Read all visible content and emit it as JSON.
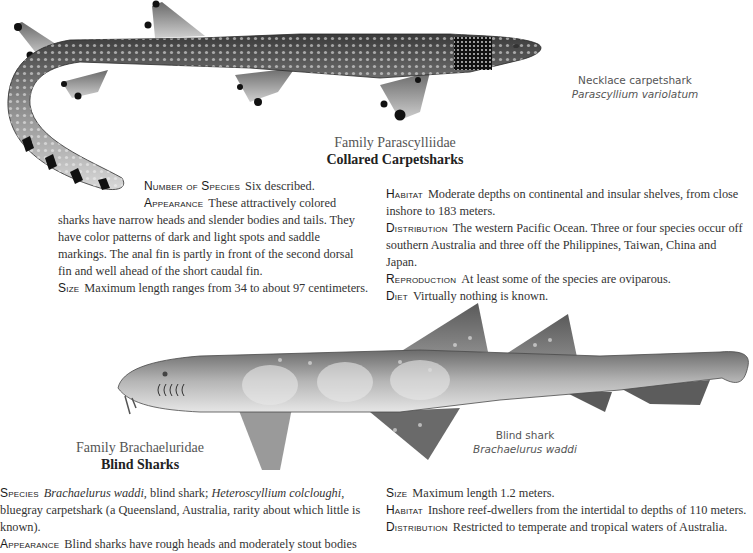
{
  "section1": {
    "illustration": {
      "name": "necklace-carpetshark-illustration",
      "common_name": "Necklace carpetshark",
      "scientific_name": "Parascyllium variolatum"
    },
    "family": {
      "name": "Family Parascylliidae",
      "common": "Collared Carpetsharks"
    },
    "left_column": [
      {
        "label": "Number of Species",
        "text": "Six described."
      },
      {
        "label": "Appearance",
        "text": "These attractively colored sharks have narrow heads and slender bodies and tails. They have color patterns of dark and light spots and saddle markings. The anal fin is partly in front of the second dorsal fin and well ahead of the short caudal fin."
      },
      {
        "label": "Size",
        "text": "Maximum length ranges from 34 to about 97 centimeters."
      }
    ],
    "right_column": [
      {
        "label": "Habitat",
        "text": "Moderate depths on continental and insular shelves, from close inshore to 183 meters."
      },
      {
        "label": "Distribution",
        "text": "The western Pacific Ocean. Three or four species occur off southern Australia and three off the Philippines, Taiwan, China and Japan."
      },
      {
        "label": "Reproduction",
        "text": "At least some of the species are oviparous."
      },
      {
        "label": "Diet",
        "text": "Virtually nothing is known."
      }
    ]
  },
  "section2": {
    "illustration": {
      "name": "blind-shark-illustration",
      "common_name": "Blind shark",
      "scientific_name": "Brachaelurus waddi"
    },
    "family": {
      "name": "Family Brachaeluridae",
      "common": "Blind Sharks"
    },
    "left_column": [
      {
        "label": "Species",
        "parts": [
          {
            "italic": true,
            "text": "Brachaelurus waddi"
          },
          {
            "italic": false,
            "text": ", blind shark; "
          },
          {
            "italic": true,
            "text": "Heteroscyllium colcloughi"
          },
          {
            "italic": false,
            "text": ", bluegray carpetshark (a Queensland, Australia, rarity about which little is known)."
          }
        ]
      },
      {
        "label": "Appearance",
        "text": "Blind sharks have rough heads and moderately stout bodies"
      }
    ],
    "right_column": [
      {
        "label": "Size",
        "text": "Maximum length 1.2 meters."
      },
      {
        "label": "Habitat",
        "text": "Inshore reef-dwellers from the intertidal to depths of 110 meters."
      },
      {
        "label": "Distribution",
        "text": "Restricted to temperate and tropical waters of Australia."
      }
    ]
  }
}
